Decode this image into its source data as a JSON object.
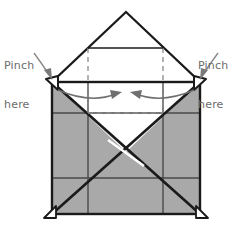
{
  "diagram": {
    "type": "origami-instruction",
    "colors": {
      "paper_fill": "#a9a9a9",
      "paper_back": "#ffffff",
      "outline": "#1a1a1a",
      "crease_line": "#3f3f3f",
      "dashed_line": "#8a8a8a",
      "arrow": "#6f6f6f",
      "label_text": "#6b6b6b",
      "background": "#ffffff"
    },
    "labels": {
      "left": {
        "line1": "Pinch",
        "line2": "here",
        "points_to": "left-pinch-corner"
      },
      "right": {
        "line1": "Pinch",
        "line2": "here",
        "points_to": "right-pinch-corner"
      }
    },
    "arrows": {
      "left_fold": "curved arrow pointing right toward center",
      "right_fold": "curved arrow pointing left toward center"
    },
    "geometry": {
      "apex": [
        126,
        12
      ],
      "left_corner": [
        52,
        82
      ],
      "right_corner": [
        200,
        82
      ],
      "bottom_left": [
        52,
        214
      ],
      "bottom_right": [
        200,
        214
      ],
      "center_cross": [
        126,
        148
      ],
      "dashed_rect": [
        88,
        48,
        163,
        113
      ],
      "inner_top_line_y": 48,
      "mid_line_y": 113,
      "lower_line_y": 178,
      "vertical_grid_x": [
        88,
        163
      ]
    }
  }
}
